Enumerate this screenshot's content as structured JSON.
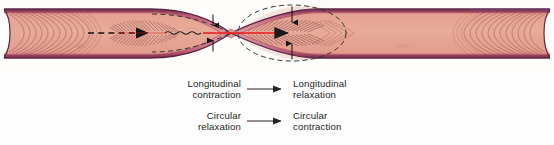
{
  "figure": {
    "name": "peristalsis-diagram"
  },
  "colors": {
    "serosa_outer_line": "#5c2747",
    "muscle_band": "#c05a6e",
    "muscle_band_light": "#d98496",
    "lumen_fill": "#e6a394",
    "lumen_fill_light": "#f0cdc0",
    "striation_stroke": "#7a3b3b",
    "dashed_outline": "#3a3a3a",
    "flow_arrow": "#e8191b",
    "axis_dashed": "#1a1a1a",
    "text": "#231f20",
    "background": "#ffffff"
  },
  "diagram": {
    "tube_label": "tube-wall",
    "lumen_label": "lumen",
    "constriction_label": "constriction-segment",
    "flow_arrow_label": "flow-direction-arrow",
    "axis_label": "lumen-axis-dashed-arrow",
    "relaxed_outline_label": "relaxed-diameter-dashed-outline",
    "contracted_outline_label": "contracted-diameter-dashed-outline",
    "diameter_arrow_left_label": "narrow-diameter-arrow",
    "diameter_arrow_right_label": "wide-diameter-arrow"
  },
  "legend": {
    "rows": [
      {
        "id": "longitudinal",
        "left_line1": "Longitudinal",
        "left_line2": "contraction",
        "arrow": "right-arrow",
        "right_line1": "Longitudinal",
        "right_line2": "relaxation"
      },
      {
        "id": "circular",
        "left_line1": "Circular",
        "left_line2": "relaxation",
        "arrow": "right-arrow",
        "right_line1": "Circular",
        "right_line2": "contraction"
      }
    ]
  }
}
